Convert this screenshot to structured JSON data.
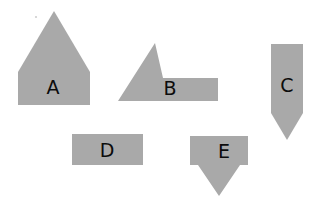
{
  "canvas": {
    "width": 320,
    "height": 208,
    "background_color": "#ffffff",
    "shape_fill_color": "#a9a9a9",
    "label_color": "#0c0c0c"
  },
  "shapes": [
    {
      "id": "A",
      "label": "A",
      "kind": "pentagon-house",
      "description": "rectangle with triangular roof, apex pointing up",
      "points": "54,11 90,72 90,105 18,105 18,72",
      "label_x": 53,
      "label_y": 88
    },
    {
      "id": "B",
      "label": "B",
      "kind": "triangle-plus-rectangle",
      "description": "upward triangle overlapping a rectangle on its right",
      "points": "163,78 218,78 218,101 118,101 155,43",
      "label_x": 170,
      "label_y": 89
    },
    {
      "id": "C",
      "label": "C",
      "kind": "pentagon-pointer-down",
      "description": "vertical rectangle with triangular tip pointing down",
      "points": "271,44 303,44 303,113 287,140 271,113",
      "label_x": 287,
      "label_y": 86
    },
    {
      "id": "D",
      "label": "D",
      "kind": "rectangle",
      "description": "plain horizontal rectangle",
      "points": "72,134 143,134 143,165 72,165",
      "label_x": 107,
      "label_y": 151
    },
    {
      "id": "E",
      "label": "E",
      "kind": "rectangle-plus-triangle-down",
      "description": "rectangle with a downward triangle below it, like a map pin",
      "points": "190,136 248,136 248,165 240,165 219,196 198,165 190,165",
      "label_x": 224,
      "label_y": 152
    }
  ],
  "artifacts": [
    {
      "name": "speck",
      "x": 36,
      "y": 17,
      "r": 1.1
    }
  ]
}
